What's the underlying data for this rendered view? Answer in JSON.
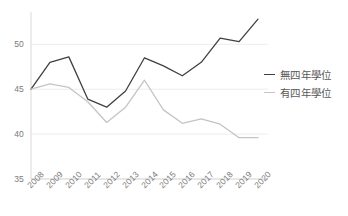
{
  "chart_data": {
    "type": "line",
    "title": "",
    "subtitle": "",
    "xlabel": "",
    "ylabel": "",
    "categories": [
      "2008",
      "2009",
      "2010",
      "2011",
      "2012",
      "2013",
      "2014",
      "2015",
      "2016",
      "2017",
      "2018",
      "2019",
      "2020"
    ],
    "series": [
      {
        "name": "無四年學位",
        "color": "#404040",
        "values": [
          45.0,
          48.0,
          48.6,
          43.9,
          43.0,
          44.8,
          48.5,
          47.6,
          46.5,
          48.0,
          50.7,
          50.3,
          52.8
        ]
      },
      {
        "name": "有四年學位",
        "color": "#c4c4c4",
        "values": [
          45.0,
          45.6,
          45.2,
          43.6,
          41.3,
          43.0,
          46.0,
          42.7,
          41.2,
          41.7,
          41.1,
          39.6,
          39.6
        ]
      }
    ],
    "ylim": [
      35,
      53.6
    ],
    "yticks": [
      35,
      40,
      45,
      50
    ],
    "ytick_labels": [
      "35",
      "40",
      "45",
      "50"
    ],
    "xtick_labels": [
      "2008",
      "2009",
      "2010",
      "2011",
      "2012",
      "2013",
      "2014",
      "2015",
      "2016",
      "2017",
      "2018",
      "2019",
      "2020"
    ],
    "grid": true,
    "grid_axis": "y",
    "grid_color": "#ededed",
    "axis_color": "#d9d9d9",
    "legend_position": "right",
    "xtick_rotation": -45,
    "background": "#ffffff"
  },
  "legend": {
    "entries": [
      {
        "label": "無四年學位",
        "color": "#404040"
      },
      {
        "label": "有四年學位",
        "color": "#c4c4c4"
      }
    ]
  },
  "axis": {
    "y_labels": [
      "50",
      "45",
      "40",
      "35"
    ],
    "x_labels": [
      "2008",
      "2009",
      "2010",
      "2011",
      "2012",
      "2013",
      "2014",
      "2015",
      "2016",
      "2017",
      "2018",
      "2019",
      "2020"
    ]
  }
}
